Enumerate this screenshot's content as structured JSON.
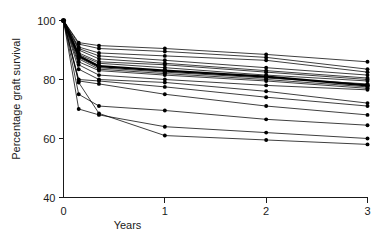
{
  "figure": {
    "background_color": "#ffffff",
    "ink_color": "#000000"
  },
  "chart_data": {
    "type": "line",
    "title": "",
    "subtitle": "",
    "xlabel": "Years",
    "ylabel": "Percentage graft survival",
    "xlim": [
      0,
      3
    ],
    "ylim": [
      40,
      100
    ],
    "xticks": [
      0,
      1,
      2,
      3
    ],
    "xtick_labels": [
      "0",
      "1",
      "2",
      "3"
    ],
    "yticks": [
      40,
      60,
      80,
      100
    ],
    "ytick_labels": [
      "40",
      "60",
      "80",
      "100"
    ],
    "grid": false,
    "legend": "none",
    "legend_position": "none",
    "annotations": [],
    "marker": "filled-circle",
    "x": [
      0,
      0.15,
      0.35,
      1,
      2,
      3
    ],
    "series": [
      {
        "name": "centre-01",
        "emphasis": "normal",
        "values": [
          100,
          92.5,
          91.5,
          90.5,
          88.5,
          86.0
        ]
      },
      {
        "name": "centre-02",
        "emphasis": "normal",
        "values": [
          100,
          92.0,
          90.5,
          89.5,
          87.5,
          83.5
        ]
      },
      {
        "name": "centre-03",
        "emphasis": "normal",
        "values": [
          100,
          91.0,
          89.0,
          88.0,
          86.5,
          82.5
        ]
      },
      {
        "name": "centre-04",
        "emphasis": "normal",
        "values": [
          100,
          90.5,
          88.0,
          86.5,
          84.0,
          81.5
        ]
      },
      {
        "name": "centre-05",
        "emphasis": "normal",
        "values": [
          100,
          90.0,
          87.0,
          85.5,
          83.0,
          80.5
        ]
      },
      {
        "name": "centre-06",
        "emphasis": "normal",
        "values": [
          100,
          89.0,
          86.0,
          85.0,
          82.5,
          80.0
        ]
      },
      {
        "name": "centre-07",
        "emphasis": "normal",
        "values": [
          100,
          88.5,
          85.5,
          84.0,
          81.5,
          79.5
        ]
      },
      {
        "name": "centre-08-mean",
        "emphasis": "bold",
        "values": [
          100,
          88.0,
          84.5,
          83.0,
          81.0,
          78.0
        ]
      },
      {
        "name": "centre-09",
        "emphasis": "normal",
        "values": [
          100,
          87.5,
          84.0,
          82.5,
          80.5,
          78.5
        ]
      },
      {
        "name": "centre-10",
        "emphasis": "normal",
        "values": [
          100,
          87.0,
          83.5,
          82.0,
          80.0,
          77.5
        ]
      },
      {
        "name": "centre-11",
        "emphasis": "normal",
        "values": [
          100,
          86.0,
          83.0,
          81.5,
          79.5,
          77.0
        ]
      },
      {
        "name": "centre-12",
        "emphasis": "normal",
        "values": [
          100,
          85.0,
          81.5,
          80.0,
          78.0,
          76.5
        ]
      },
      {
        "name": "centre-13",
        "emphasis": "normal",
        "values": [
          100,
          83.5,
          80.0,
          79.0,
          76.0,
          72.0
        ]
      },
      {
        "name": "centre-14",
        "emphasis": "normal",
        "values": [
          100,
          80.0,
          79.5,
          77.5,
          74.0,
          71.0
        ]
      },
      {
        "name": "centre-15",
        "emphasis": "normal",
        "values": [
          100,
          79.5,
          78.5,
          75.0,
          71.0,
          68.0
        ]
      },
      {
        "name": "centre-16",
        "emphasis": "normal",
        "values": [
          100,
          75.0,
          71.0,
          69.5,
          66.5,
          64.5
        ]
      },
      {
        "name": "centre-17",
        "emphasis": "normal",
        "values": [
          100,
          70.0,
          68.0,
          64.0,
          62.0,
          60.0
        ]
      },
      {
        "name": "centre-18",
        "emphasis": "normal",
        "values": [
          100,
          79.0,
          68.5,
          61.0,
          59.5,
          58.0
        ]
      }
    ]
  }
}
